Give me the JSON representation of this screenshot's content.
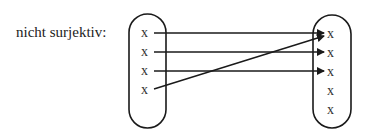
{
  "label": "nicht surjektiv:",
  "domain_set": {
    "elements": [
      "x",
      "x",
      "x",
      "x"
    ]
  },
  "codomain_set": {
    "elements": [
      "x",
      "x",
      "x",
      "x",
      "x"
    ]
  },
  "mappings": [
    {
      "from": 0,
      "to": 0
    },
    {
      "from": 1,
      "to": 1
    },
    {
      "from": 2,
      "to": 2
    },
    {
      "from": 3,
      "to": 0
    }
  ],
  "colors": {
    "stroke": "#1a1a1a",
    "text": "#333333"
  }
}
